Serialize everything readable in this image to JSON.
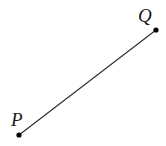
{
  "figure": {
    "type": "geometry-line-segment",
    "canvas": {
      "width": 166,
      "height": 146,
      "background": "#ffffff"
    },
    "style": {
      "line_color": "#2b2b2b",
      "line_width": 1,
      "point_color": "#000000",
      "point_radius": 2.6,
      "label_color": "#1a1a1a",
      "label_font_size": 19,
      "label_font_style": "italic"
    },
    "points": [
      {
        "name": "P",
        "label": "P",
        "x": 19,
        "y": 135,
        "label_x": 11,
        "label_y": 110
      },
      {
        "name": "Q",
        "label": "Q",
        "x": 156,
        "y": 30,
        "label_x": 138,
        "label_y": 6
      }
    ],
    "segments": [
      {
        "name": "PQ",
        "from": "P",
        "to": "Q",
        "x1": 19,
        "y1": 135,
        "x2": 156,
        "y2": 30
      }
    ]
  }
}
